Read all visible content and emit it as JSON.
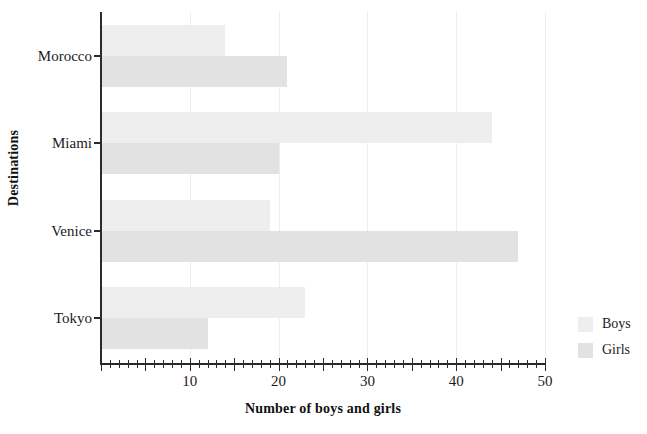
{
  "chart_data": {
    "type": "bar",
    "orientation": "horizontal",
    "title": "",
    "xlabel": "Number of boys and girls",
    "ylabel": "Destinations",
    "categories": [
      "Morocco",
      "Miami",
      "Venice",
      "Tokyo"
    ],
    "series": [
      {
        "name": "Boys",
        "color": "#eeeeee",
        "values": [
          14,
          44,
          19,
          23
        ]
      },
      {
        "name": "Girls",
        "color": "#e2e2e2",
        "values": [
          21,
          20,
          47,
          12
        ]
      }
    ],
    "xlim": [
      0,
      50
    ],
    "xticks": [
      10,
      20,
      30,
      40,
      50
    ],
    "xtick_labels": [
      "10",
      "20",
      "30",
      "40",
      "50"
    ],
    "xtick_minor_step": 1,
    "xtick_major_step": 5,
    "grid": "vertical",
    "legend_position": "right",
    "background": "#ffffff",
    "axis_color": "#2b2b2b",
    "grid_color": "#ededed"
  },
  "legend": {
    "items": [
      {
        "label": "Boys"
      },
      {
        "label": "Girls"
      }
    ]
  },
  "axes": {
    "x_title": "Number of boys and girls",
    "y_title": "Destinations",
    "x_tick_labels": [
      "10",
      "20",
      "30",
      "40",
      "50"
    ],
    "y_tick_labels": [
      "Morocco",
      "Miami",
      "Venice",
      "Tokyo"
    ]
  }
}
